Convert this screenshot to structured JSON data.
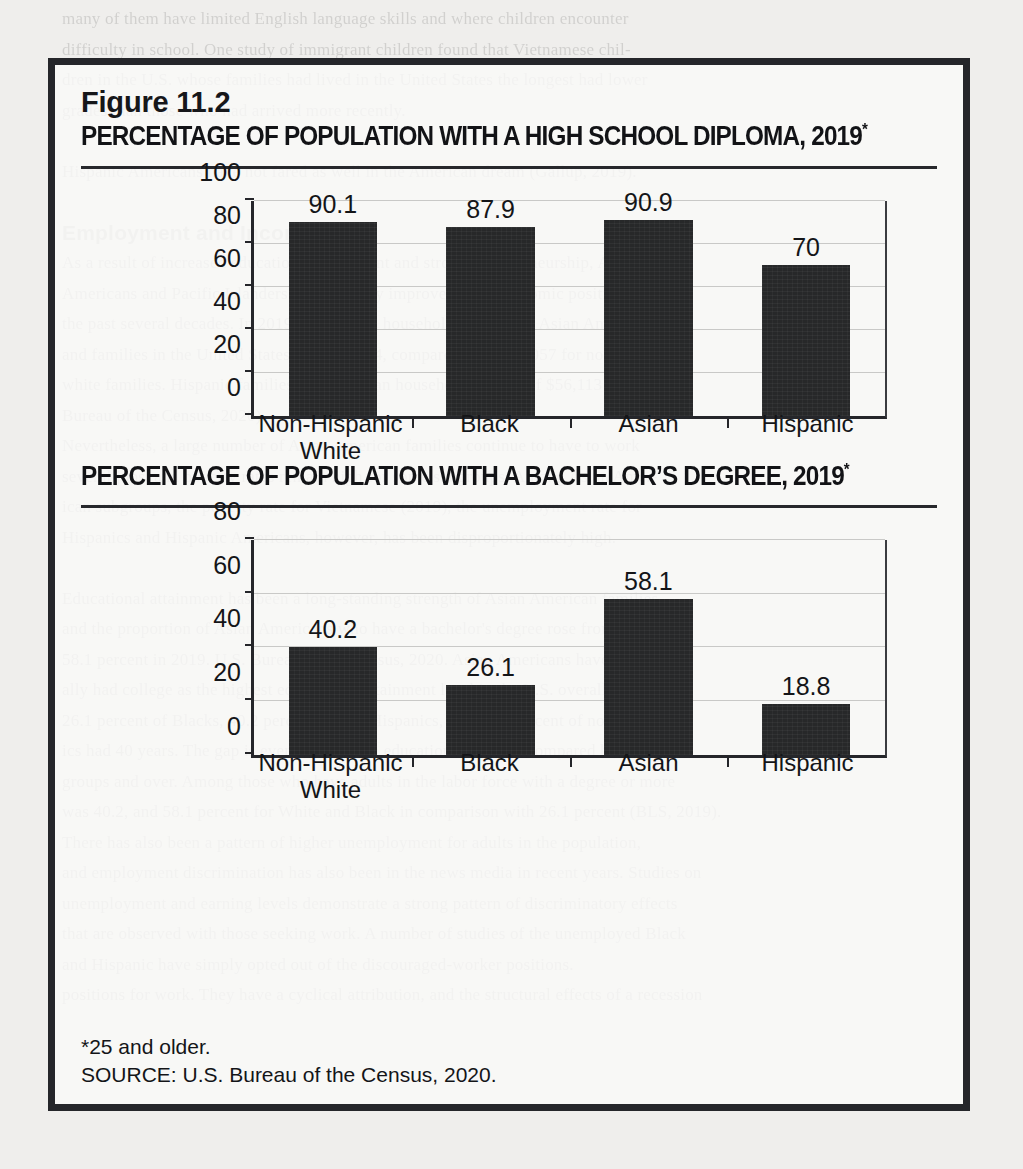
{
  "page": {
    "background_color": "#efeeec",
    "figure_border_color": "#25262a",
    "bar_color": "#272829",
    "text_color": "#141518",
    "bleed_lines": [
      "many of them have limited English language skills and where children encounter",
      "difficulty in school. One study of immigrant children found that Vietnamese chil-",
      "dren in the U.S. whose families had lived in the United States the longest had lower",
      "grades than those who had arrived more recently.",
      "",
      "Hispanic Americans have not fared as well in the American dream (Gallup, 2019).",
      "",
      "Employment and Income",
      "As a result of increased educational attainment and strong entrepreneurship, Asian",
      "Americans and Pacific Islanders have steadily improved their economic position over",
      "the past several decades. In 2019, the median household income for Asian Americans",
      "and families in the United States was $98,174, compared with $76,057 for non-Hispanic",
      "white families. Hispanic families had a median household income of $56,113 (U.S.",
      "Bureau of the Census, 2020).",
      "Nevertheless, a large number of Asian American families continue to have to work",
      "several jobs, and poverty rates remain high for some subgroups. Among Asian Amer-",
      "ican subgroups, the poverty rate for Vietnamese (2019), the unemployment rate for",
      "Hispanics and Hispanic Americans, however, has been disproportionately high.",
      "",
      "Educational attainment has been a long-standing strength of Asian American families",
      "and the proportion of Asian Americans who have a bachelor's degree rose from 39.2 to",
      "58.1 percent in 2019. U.S. Bureau of the Census, 2020. Asian Americans have tradition-",
      "ally had college as the highest educational attainment level in the U.S. overall. While",
      "26.1 percent of Blacks, 40.2 percent of non-Hispanics, and 40.2 percent of non-Hispan-",
      "ics had 40 years. The gap is even wider when education levels are compared between age",
      "groups and over. Among those who have adults in the labor force with a degree or more",
      "was 40.2, and 58.1 percent for White and Black in comparison with 26.1 percent (BLS, 2019).",
      "There has also been a pattern of higher unemployment for adults in the population,",
      "and employment discrimination has also been in the news media in recent years. Studies on",
      "unemployment and earning levels demonstrate a strong pattern of discriminatory effects",
      "that are observed with those seeking work. A number of studies of the unemployed Black",
      "and Hispanic have simply opted out of the discouraged-worker positions.",
      "positions for work. They have a cyclical attribution, and the structural effects of a recession"
    ]
  },
  "figure": {
    "number": "Figure 11.2",
    "title_1": "PERCENTAGE OF POPULATION WITH A HIGH SCHOOL DIPLOMA, 2019",
    "title_1_asterisk": "*",
    "title_2": "PERCENTAGE OF POPULATION WITH A BACHELOR’S DEGREE, 2019",
    "title_2_asterisk": "*",
    "footnote": "*25 and older.",
    "source": "SOURCE: U.S. Bureau of the Census, 2020."
  },
  "chart_data": [
    {
      "type": "bar",
      "title": "PERCENTAGE OF POPULATION WITH A HIGH SCHOOL DIPLOMA, 2019*",
      "categories": [
        "Non-Hispanic White",
        "Black",
        "Asian",
        "Hispanic"
      ],
      "values": [
        90.1,
        87.9,
        90.9,
        70
      ],
      "value_labels": [
        "90.1",
        "87.9",
        "90.9",
        "70"
      ],
      "ylim": [
        0,
        100
      ],
      "yticks": [
        0,
        20,
        40,
        60,
        80,
        100
      ],
      "ytick_labels": [
        "0",
        "20",
        "40",
        "60",
        "80",
        "100"
      ],
      "xlabel": "",
      "ylabel": "",
      "grid": true,
      "legend": "none"
    },
    {
      "type": "bar",
      "title": "PERCENTAGE OF POPULATION WITH A BACHELOR’S DEGREE, 2019*",
      "categories": [
        "Non-Hispanic White",
        "Black",
        "Asian",
        "Hispanic"
      ],
      "values": [
        40.2,
        26.1,
        58.1,
        18.8
      ],
      "value_labels": [
        "40.2",
        "26.1",
        "58.1",
        "18.8"
      ],
      "ylim": [
        0,
        80
      ],
      "yticks": [
        0,
        20,
        40,
        60,
        80
      ],
      "ytick_labels": [
        "0",
        "20",
        "40",
        "60",
        "80"
      ],
      "xlabel": "",
      "ylabel": "",
      "grid": true,
      "legend": "none"
    }
  ]
}
